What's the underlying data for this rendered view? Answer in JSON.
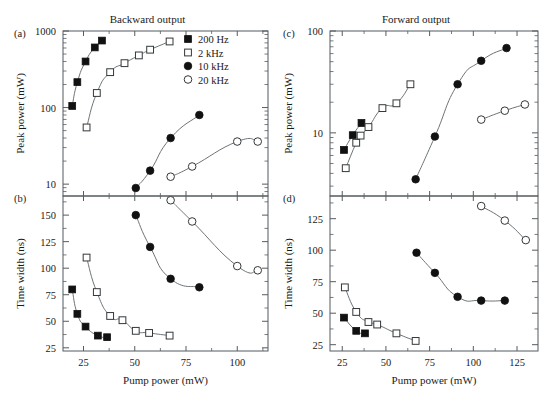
{
  "figure": {
    "xlabel": "Pump power (mW)",
    "ylabel_power": "Peak power (mW)",
    "ylabel_width": "Time width (ns)",
    "title_left": "Backward output",
    "title_right": "Forward output",
    "panel_labels": {
      "a": "(a)",
      "b": "(b)",
      "c": "(c)",
      "d": "(d)"
    }
  },
  "legend": {
    "position": "top-right of panel (a)",
    "items": [
      {
        "label": "200 Hz",
        "marker": "filled-square"
      },
      {
        "label": "2 kHz",
        "marker": "open-square"
      },
      {
        "label": "10 kHz",
        "marker": "filled-circle"
      },
      {
        "label": "20 kHz",
        "marker": "open-circle"
      }
    ]
  },
  "colors": {
    "axis": "#555b5e",
    "curve": "#6e7376",
    "marker_fill": "#111111",
    "marker_open_fill": "#ffffff",
    "marker_open_stroke": "#33383b",
    "background": "#ffffff"
  },
  "chart_data": [
    {
      "id": "panel-a",
      "type": "scatter",
      "title": "Backward output",
      "panel": "(a)",
      "xlabel": "",
      "ylabel": "Peak power (mW)",
      "xscale": "linear",
      "yscale": "log",
      "xlim": [
        15,
        115
      ],
      "ylim": [
        7,
        1000
      ],
      "xticks": [
        25,
        50,
        75,
        100
      ],
      "yticks": [
        10,
        100,
        1000
      ],
      "ytick_labels": [
        "10",
        "100",
        "1000"
      ],
      "grid": false,
      "series": [
        {
          "name": "200 Hz",
          "marker": "filled-square",
          "points": [
            [
              19.5,
              105
            ],
            [
              22,
              215
            ],
            [
              26,
              400
            ],
            [
              30.5,
              610
            ],
            [
              34,
              750
            ]
          ]
        },
        {
          "name": "2 kHz",
          "marker": "open-square",
          "points": [
            [
              26.5,
              55
            ],
            [
              31.5,
              155
            ],
            [
              38,
              290
            ],
            [
              45,
              380
            ],
            [
              52,
              480
            ],
            [
              57.5,
              570
            ],
            [
              67,
              730
            ]
          ]
        },
        {
          "name": "10 kHz",
          "marker": "filled-circle",
          "points": [
            [
              50.5,
              8.9
            ],
            [
              57.5,
              15
            ],
            [
              67.5,
              40
            ],
            [
              81.5,
              80
            ]
          ]
        },
        {
          "name": "20 kHz",
          "marker": "open-circle",
          "points": [
            [
              67.5,
              12.5
            ],
            [
              78,
              17
            ],
            [
              100,
              36
            ],
            [
              110,
              36
            ]
          ]
        }
      ]
    },
    {
      "id": "panel-b",
      "type": "scatter",
      "title": "",
      "panel": "(b)",
      "xlabel": "Pump power (mW)",
      "ylabel": "Time width (ns)",
      "xscale": "linear",
      "yscale": "linear",
      "xlim": [
        15,
        115
      ],
      "ylim": [
        22,
        168
      ],
      "xticks": [
        25,
        50,
        75,
        100
      ],
      "yticks": [
        25,
        50,
        75,
        100,
        125,
        150
      ],
      "grid": false,
      "series": [
        {
          "name": "200 Hz",
          "marker": "filled-square",
          "points": [
            [
              19.5,
              80
            ],
            [
              22,
              57
            ],
            [
              26,
              45
            ],
            [
              32,
              36.5
            ],
            [
              36.5,
              35
            ]
          ]
        },
        {
          "name": "2 kHz",
          "marker": "open-square",
          "points": [
            [
              26.5,
              110
            ],
            [
              31.5,
              77.5
            ],
            [
              38,
              55
            ],
            [
              44,
              51
            ],
            [
              50.5,
              41
            ],
            [
              57,
              39
            ],
            [
              67,
              36.5
            ]
          ]
        },
        {
          "name": "10 kHz",
          "marker": "filled-circle",
          "points": [
            [
              50.5,
              150
            ],
            [
              57.5,
              120
            ],
            [
              67.5,
              90
            ],
            [
              81.5,
              82
            ]
          ]
        },
        {
          "name": "20 kHz",
          "marker": "open-circle",
          "points": [
            [
              67.5,
              164
            ],
            [
              78,
              144
            ],
            [
              100,
              102
            ],
            [
              110,
              98
            ]
          ]
        }
      ]
    },
    {
      "id": "panel-c",
      "type": "scatter",
      "title": "Forward output",
      "panel": "(c)",
      "xlabel": "",
      "ylabel": "Peak power (mW)",
      "xscale": "linear",
      "yscale": "log",
      "xlim": [
        18,
        137
      ],
      "ylim": [
        2.4,
        100
      ],
      "xticks": [
        25,
        50,
        75,
        100,
        125
      ],
      "yticks": [
        10,
        100
      ],
      "ytick_labels": [
        "10",
        "100"
      ],
      "grid": false,
      "series": [
        {
          "name": "200 Hz",
          "marker": "filled-square",
          "points": [
            [
              26,
              6.8
            ],
            [
              31,
              9.5
            ],
            [
              36,
              12.5
            ]
          ]
        },
        {
          "name": "2 kHz",
          "marker": "open-square",
          "points": [
            [
              27,
              4.5
            ],
            [
              33,
              8.0
            ],
            [
              35.5,
              9.4
            ],
            [
              40,
              11.4
            ],
            [
              48,
              17.5
            ],
            [
              56,
              19.5
            ],
            [
              64,
              30
            ]
          ]
        },
        {
          "name": "10 kHz",
          "marker": "filled-circle",
          "points": [
            [
              67,
              3.5
            ],
            [
              78,
              9.2
            ],
            [
              91,
              30
            ],
            [
              104.5,
              51
            ],
            [
              119,
              68
            ]
          ]
        },
        {
          "name": "20 kHz",
          "marker": "open-circle",
          "points": [
            [
              104.5,
              13.5
            ],
            [
              118,
              16.5
            ],
            [
              129.5,
              19
            ]
          ]
        }
      ]
    },
    {
      "id": "panel-d",
      "type": "scatter",
      "title": "",
      "panel": "(d)",
      "xlabel": "Pump power (mW)",
      "ylabel": "Time width (ns)",
      "xscale": "linear",
      "yscale": "linear",
      "xlim": [
        18,
        137
      ],
      "ylim": [
        20,
        143
      ],
      "xticks": [
        25,
        50,
        75,
        100,
        125
      ],
      "yticks": [
        25,
        50,
        75,
        100,
        125
      ],
      "grid": false,
      "series": [
        {
          "name": "200 Hz",
          "marker": "filled-square",
          "points": [
            [
              26,
              46.5
            ],
            [
              33,
              36
            ],
            [
              38,
              34
            ]
          ]
        },
        {
          "name": "2 kHz",
          "marker": "open-square",
          "points": [
            [
              26.5,
              70.5
            ],
            [
              33,
              51
            ],
            [
              40,
              43
            ],
            [
              45,
              41
            ],
            [
              56,
              34
            ],
            [
              67,
              28
            ]
          ]
        },
        {
          "name": "10 kHz",
          "marker": "filled-circle",
          "points": [
            [
              67.5,
              98
            ],
            [
              78,
              82
            ],
            [
              91,
              63
            ],
            [
              104.5,
              60
            ],
            [
              118,
              60
            ]
          ]
        },
        {
          "name": "20 kHz",
          "marker": "open-circle",
          "points": [
            [
              104.5,
              135
            ],
            [
              118,
              123.5
            ],
            [
              130,
              108
            ]
          ]
        }
      ]
    }
  ]
}
